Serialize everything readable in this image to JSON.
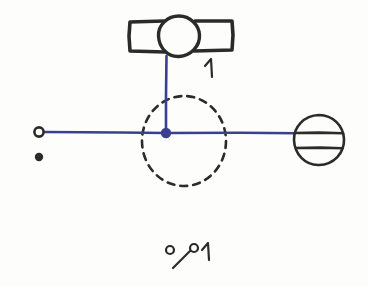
{
  "diagram": {
    "background_color": "#fdfdfc",
    "ink_color": "#2b2b2b",
    "wire_color": "#3b3f8f",
    "labels": {
      "valve_label": "1",
      "legend_label": "1"
    },
    "components": [
      {
        "id": "valve-symbol",
        "name": "gate-valve-symbol",
        "kind": "valve",
        "description": "circle with rectangular wings left and right",
        "x": 179,
        "y": 36,
        "radius": 20,
        "label": "1",
        "color": "#2b2b2b"
      },
      {
        "id": "vertical-wire",
        "name": "vertical-connector-wire",
        "kind": "wire",
        "from_x": 166,
        "from_y": 56,
        "to_x": 166,
        "to_y": 133,
        "color": "#3b3f8f"
      },
      {
        "id": "horizontal-wire",
        "name": "horizontal-bus-wire",
        "kind": "wire",
        "from_x": 44,
        "from_y": 132,
        "to_x": 296,
        "to_y": 133,
        "color": "#3b3f8f"
      },
      {
        "id": "junction-node",
        "name": "junction-node-dot",
        "kind": "node",
        "filled": true,
        "x": 166,
        "y": 133,
        "radius": 5,
        "color": "#3b3f8f"
      },
      {
        "id": "dashed-boundary",
        "name": "dashed-boundary-circle",
        "kind": "boundary",
        "x": 184,
        "y": 141,
        "radius": 45,
        "style": "dashed",
        "color": "#2b2b2b"
      },
      {
        "id": "left-terminal",
        "name": "left-open-terminal",
        "kind": "terminal",
        "filled": false,
        "x": 39,
        "y": 132,
        "radius": 5,
        "color": "#2b2b2b"
      },
      {
        "id": "left-dot",
        "name": "left-filled-dot",
        "kind": "dot",
        "filled": true,
        "x": 39,
        "y": 157,
        "radius": 4,
        "color": "#2b2b2b"
      },
      {
        "id": "right-element",
        "name": "banded-ellipse-symbol",
        "kind": "component",
        "description": "ellipse crossed by two horizontal bands",
        "x": 319,
        "y": 140,
        "rx": 25,
        "ry": 25,
        "bands": 2,
        "color": "#2b2b2b"
      },
      {
        "id": "legend-switch",
        "name": "legend-switch-symbol",
        "kind": "legend",
        "description": "open circle, diagonal stroke, pivot circle and numeral",
        "x": 190,
        "y": 252,
        "label": "1",
        "color": "#2b2b2b"
      }
    ]
  }
}
